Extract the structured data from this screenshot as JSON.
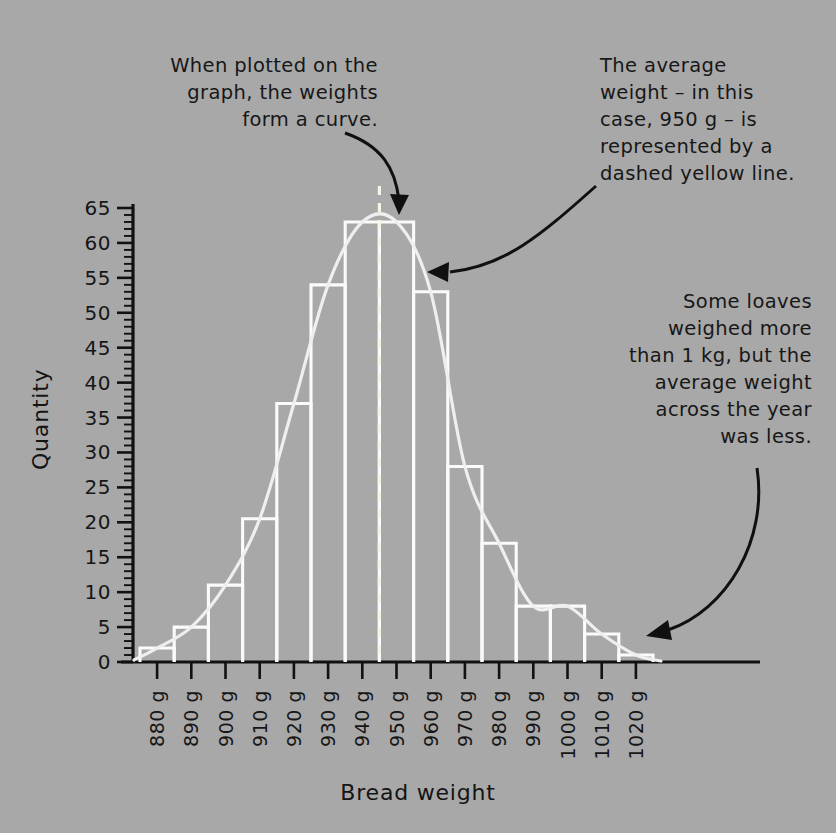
{
  "chart_data": {
    "type": "bar",
    "title": "",
    "subtitle": "",
    "xlabel": "Bread weight",
    "ylabel": "Quantity",
    "categories": [
      "880 g",
      "890 g",
      "900 g",
      "910 g",
      "920 g",
      "930 g",
      "940 g",
      "950 g",
      "960 g",
      "970 g",
      "980 g",
      "990 g",
      "1000 g",
      "1010 g",
      "1020 g"
    ],
    "values": [
      2,
      5,
      11,
      20.5,
      37,
      54,
      63,
      63,
      53,
      28,
      17,
      8,
      8,
      4,
      1
    ],
    "ylim": [
      0,
      65
    ],
    "ytick_labels": [
      "0",
      "5",
      "10",
      "15",
      "20",
      "25",
      "30",
      "35",
      "40",
      "45",
      "50",
      "55",
      "60",
      "65"
    ],
    "ytick_values": [
      0,
      5,
      10,
      15,
      20,
      25,
      30,
      35,
      40,
      45,
      50,
      55,
      60,
      65
    ],
    "ytick_step": 5,
    "minor_tick_step": 1,
    "grid": false,
    "legend": "none",
    "overlay_curve": {
      "name": "normal distribution curve",
      "style": "smooth solid light line",
      "color": "#efefef"
    },
    "mean_marker": {
      "label": "950 g",
      "value": 950,
      "style": "dashed vertical line",
      "color": "#f6f4e6"
    },
    "annotations": [
      {
        "id": "curve-note",
        "text": "When plotted on the\ngraph, the weights\nform a curve.",
        "points_to": "peak of the overlay curve"
      },
      {
        "id": "average-note",
        "text": "The average\nweight – in this\ncase, 950 g – is\nrepresented by a\ndashed yellow line.",
        "points_to": "dashed yellow mean line"
      },
      {
        "id": "loaves-note",
        "text": "Some loaves\nweighed more\nthan 1 kg, but the\naverage weight\nacross the year\nwas less.",
        "points_to": "bars above 1000 g"
      }
    ],
    "colors": {
      "background": "#a8a8a8",
      "bar_outline": "#fbfbfb",
      "curve": "#efefef",
      "mean_line": "#f6f4e6",
      "axis": "#111111",
      "text": "#161616",
      "arrow": "#101010"
    }
  },
  "axes": {
    "y_title": "Quantity",
    "x_title": "Bread weight"
  }
}
